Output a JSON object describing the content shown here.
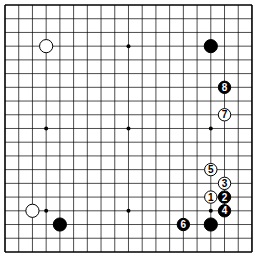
{
  "board": {
    "size": 19,
    "origin_x": 5,
    "origin_y": 5,
    "spacing": 13.72,
    "hoshi": [
      [
        3,
        3
      ],
      [
        9,
        3
      ],
      [
        15,
        3
      ],
      [
        3,
        9
      ],
      [
        9,
        9
      ],
      [
        15,
        9
      ],
      [
        3,
        15
      ],
      [
        9,
        15
      ],
      [
        15,
        15
      ]
    ],
    "stones": [
      {
        "col": 3,
        "row": 3,
        "color": "white",
        "label": ""
      },
      {
        "col": 15,
        "row": 3,
        "color": "black",
        "label": ""
      },
      {
        "col": 16,
        "row": 6,
        "color": "black",
        "label": "8"
      },
      {
        "col": 16,
        "row": 8,
        "color": "white",
        "label": "7"
      },
      {
        "col": 15,
        "row": 12,
        "color": "white",
        "label": "5"
      },
      {
        "col": 16,
        "row": 13,
        "color": "white",
        "label": "3"
      },
      {
        "col": 15,
        "row": 14,
        "color": "white",
        "label": "1"
      },
      {
        "col": 16,
        "row": 14,
        "color": "black",
        "label": "2"
      },
      {
        "col": 16,
        "row": 15,
        "color": "black",
        "label": "4"
      },
      {
        "col": 15,
        "row": 16,
        "color": "black",
        "label": ""
      },
      {
        "col": 13,
        "row": 16,
        "color": "black",
        "label": "6"
      },
      {
        "col": 2,
        "row": 15,
        "color": "white",
        "label": ""
      },
      {
        "col": 4,
        "row": 16,
        "color": "black",
        "label": ""
      }
    ]
  }
}
